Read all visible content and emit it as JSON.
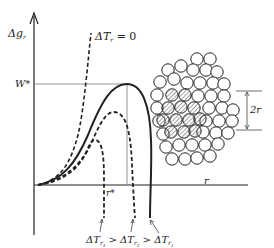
{
  "diagram": {
    "type": "nucleation free energy vs. cluster radius",
    "y_axis_label": "Δg",
    "y_axis_subscript": "r",
    "x_axis_label": "r",
    "w_star_label": "W*",
    "r_star_label": "r*",
    "curve_top_label": "ΔT",
    "curve_top_label_sub": "r",
    "curve_top_label_value": "= 0",
    "bottom_label": {
      "part1": "ΔT",
      "sub1": "r",
      "subsub1": "3",
      "gt1": ">",
      "part2": "ΔT",
      "sub2": "r",
      "subsub2": "2",
      "gt2": ">",
      "part3": "ΔT",
      "sub3": "r",
      "subsub3": "1"
    },
    "dimension_label": "2r",
    "curves": [
      {
        "name": "ΔTr = 0",
        "style": "dashed",
        "behavior": "monotonic increasing"
      },
      {
        "name": "ΔTr1",
        "style": "solid",
        "behavior": "maximum W* at r*"
      },
      {
        "name": "ΔTr2",
        "style": "dashed",
        "behavior": "lower maximum"
      },
      {
        "name": "ΔTr3",
        "style": "dashed",
        "behavior": "lowest maximum"
      }
    ],
    "cluster": {
      "description": "close-packed atoms with hatched central nucleus",
      "hatched_count": 12
    },
    "colors": {
      "line": "#222222",
      "guide": "#777777",
      "hatch": "#555555"
    }
  }
}
